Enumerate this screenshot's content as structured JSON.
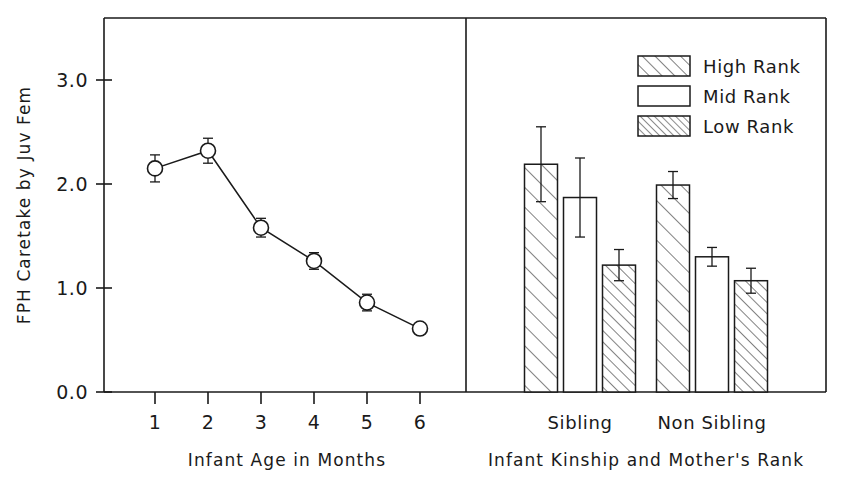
{
  "chart_data": [
    {
      "type": "line",
      "panel": "left",
      "title": "",
      "xlabel": "Infant Age in Months",
      "ylabel": "FPH Caretake by Juv Fem",
      "x": [
        1,
        2,
        3,
        4,
        5,
        6
      ],
      "xticklabels": [
        "1",
        "2",
        "3",
        "4",
        "5",
        "6"
      ],
      "values": [
        2.15,
        2.32,
        1.58,
        1.26,
        0.86,
        0.61
      ],
      "errors": [
        0.13,
        0.12,
        0.09,
        0.08,
        0.08,
        0.05
      ],
      "yticklabels": [
        "0.0",
        "1.0",
        "2.0",
        "3.0"
      ],
      "yticks": [
        0.0,
        1.0,
        2.0,
        3.0
      ],
      "ylim": [
        0.0,
        3.35
      ],
      "grid": false,
      "marker": "open-circle",
      "legend": "none"
    },
    {
      "type": "bar",
      "panel": "right",
      "title": "",
      "xlabel": "Infant Kinship and Mother's Rank",
      "ylabel": "FPH Caretake by Juv Fem",
      "categories": [
        "Sibling",
        "Non Sibling"
      ],
      "series": [
        {
          "name": "High Rank",
          "pattern": "wide-hatch",
          "values": [
            2.19,
            1.99
          ],
          "errors": [
            0.36,
            0.13
          ]
        },
        {
          "name": "Mid Rank",
          "pattern": "none",
          "values": [
            1.87,
            1.3
          ],
          "errors": [
            0.38,
            0.09
          ]
        },
        {
          "name": "Low Rank",
          "pattern": "dense-hatch",
          "values": [
            1.22,
            1.07
          ],
          "errors": [
            0.15,
            0.12
          ]
        }
      ],
      "yticks": [
        0.0,
        1.0,
        2.0,
        3.0
      ],
      "ylim": [
        0.0,
        3.35
      ],
      "grid": false,
      "legend_position": "top-right"
    }
  ],
  "axes": {
    "y_title": "FPH Caretake by Juv Fem",
    "y_ticklabels": [
      "3.0",
      "2.0",
      "1.0",
      "0.0"
    ],
    "left_x_title": "Infant Age in Months",
    "left_x_ticklabels": [
      "1",
      "2",
      "3",
      "4",
      "5",
      "6"
    ],
    "right_x_title": "Infant Kinship and Mother's Rank",
    "right_x_ticklabels": [
      "Sibling",
      "Non Sibling"
    ]
  },
  "legend": {
    "items": [
      {
        "label": "High Rank",
        "pattern": "wide-hatch"
      },
      {
        "label": "Mid Rank",
        "pattern": "none"
      },
      {
        "label": "Low Rank",
        "pattern": "dense-hatch"
      }
    ]
  },
  "style": {
    "ink": "#1a1a1a",
    "background": "#ffffff"
  }
}
